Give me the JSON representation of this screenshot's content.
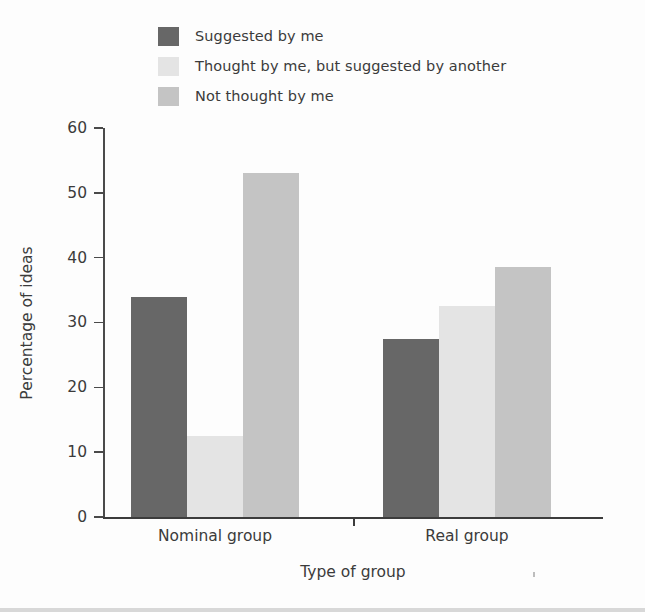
{
  "chart_data": {
    "type": "bar",
    "title": "",
    "xlabel": "Type of group",
    "ylabel": "Percentage of ideas",
    "categories": [
      "Nominal group",
      "Real group"
    ],
    "series": [
      {
        "name": "Suggested by me",
        "values": [
          34,
          27.5
        ],
        "color": "#676767"
      },
      {
        "name": "Thought by me, but suggested by another",
        "values": [
          12.5,
          32.5
        ],
        "color": "#e4e4e4"
      },
      {
        "name": "Not thought by me",
        "values": [
          53,
          38.5
        ],
        "color": "#c4c4c4"
      }
    ],
    "ylim": [
      0,
      60
    ],
    "yticks": [
      0,
      10,
      20,
      30,
      40,
      50,
      60
    ],
    "ytick_labels": [
      "0",
      "10",
      "20",
      "30",
      "40",
      "50",
      "60"
    ],
    "grid": false,
    "legend_position": "top-left",
    "background": "#fdfdfd",
    "axis_color": "#3c3c3c",
    "text_color": "#3b3b3b"
  }
}
